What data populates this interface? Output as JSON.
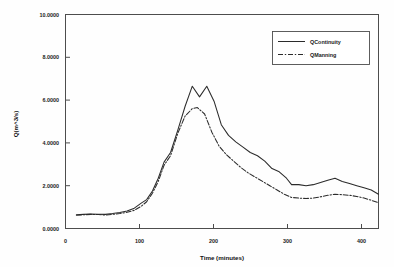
{
  "chart_data": {
    "type": "line",
    "title": "",
    "subtitle": "",
    "xlabel": "Time (minutes)",
    "ylabel": "Q(m^3/s)",
    "xlim": [
      0,
      432
    ],
    "ylim": [
      0,
      10
    ],
    "grid": false,
    "legend_position": "top-right",
    "xticks": [
      0,
      100,
      200,
      300,
      400
    ],
    "xtick_labels": [
      "0",
      "100",
      "200",
      "300",
      "400"
    ],
    "yticks": [
      0,
      2,
      4,
      6,
      8,
      10
    ],
    "ytick_labels": [
      "0.0000",
      "2.0000",
      "4.0000",
      "6.0000",
      "8.0000",
      "10.0000"
    ],
    "series": [
      {
        "name": "QContinuity",
        "style": "solid",
        "color": "#2b2b2b",
        "x": [
          15,
          25,
          35,
          45,
          55,
          65,
          75,
          85,
          95,
          105,
          112,
          120,
          128,
          136,
          145,
          155,
          165,
          175,
          185,
          195,
          205,
          215,
          225,
          235,
          245,
          255,
          265,
          275,
          285,
          295,
          305,
          312,
          322,
          332,
          342,
          352,
          362,
          372,
          382,
          392,
          402,
          412,
          422,
          432
        ],
        "y": [
          0.64,
          0.66,
          0.68,
          0.67,
          0.66,
          0.7,
          0.75,
          0.82,
          0.95,
          1.2,
          1.35,
          1.75,
          2.35,
          3.1,
          3.55,
          4.6,
          5.7,
          6.65,
          6.15,
          6.65,
          5.95,
          4.85,
          4.35,
          4.05,
          3.8,
          3.55,
          3.4,
          3.15,
          2.8,
          2.65,
          2.35,
          2.05,
          2.05,
          2.0,
          2.05,
          2.15,
          2.25,
          2.35,
          2.2,
          2.1,
          2.0,
          1.9,
          1.8,
          1.6
        ]
      },
      {
        "name": "QManning",
        "style": "dash-dot",
        "color": "#2b2b2b",
        "x": [
          15,
          25,
          35,
          45,
          55,
          65,
          75,
          85,
          95,
          105,
          112,
          120,
          128,
          136,
          145,
          155,
          165,
          175,
          182,
          192,
          202,
          212,
          222,
          232,
          242,
          252,
          262,
          272,
          282,
          292,
          302,
          312,
          322,
          332,
          342,
          352,
          362,
          372,
          382,
          392,
          402,
          412,
          422,
          432
        ],
        "y": [
          0.62,
          0.64,
          0.66,
          0.65,
          0.63,
          0.66,
          0.7,
          0.76,
          0.85,
          1.05,
          1.25,
          1.65,
          2.2,
          2.95,
          3.4,
          4.45,
          5.25,
          5.6,
          5.65,
          5.35,
          4.5,
          3.85,
          3.45,
          3.15,
          2.85,
          2.6,
          2.4,
          2.2,
          2.0,
          1.8,
          1.6,
          1.45,
          1.42,
          1.4,
          1.42,
          1.48,
          1.55,
          1.6,
          1.58,
          1.55,
          1.5,
          1.42,
          1.32,
          1.2
        ]
      }
    ],
    "legend_entries": [
      "QContinuity",
      "QManning"
    ]
  }
}
